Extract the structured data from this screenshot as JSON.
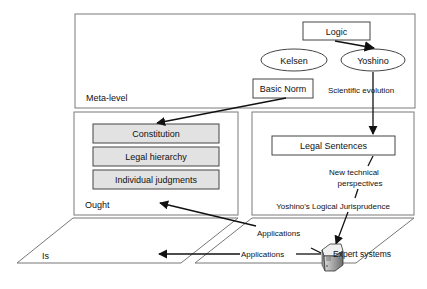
{
  "diagram": {
    "levels": {
      "meta": {
        "label": "Meta-level"
      },
      "ought": {
        "label": "Ought"
      },
      "is": {
        "label": "Is"
      }
    },
    "nodes": {
      "logic": "Logic",
      "kelsen": "Kelsen",
      "yoshino": "Yoshino",
      "basic_norm": "Basic Norm",
      "constitution": "Constitution",
      "legal_hierarchy": "Legal hierarchy",
      "individual_judgments": "Individual judgments",
      "legal_sentences": "Legal Sentences",
      "expert_systems": "Expert systems"
    },
    "edge_labels": {
      "scientific_evolution": "Scientific evolution",
      "new_technical_1": "New technical",
      "new_technical_2": "perspectives",
      "logical_jurisprudence": "Yoshino's Logical Jurisprudence",
      "applications_ought": "Applications",
      "applications_is": "Applications"
    },
    "colors": {
      "line": "#555555",
      "arrow": "#111111",
      "box_fill_gray": "#e2e2e2",
      "box_fill_white": "#ffffff"
    }
  }
}
